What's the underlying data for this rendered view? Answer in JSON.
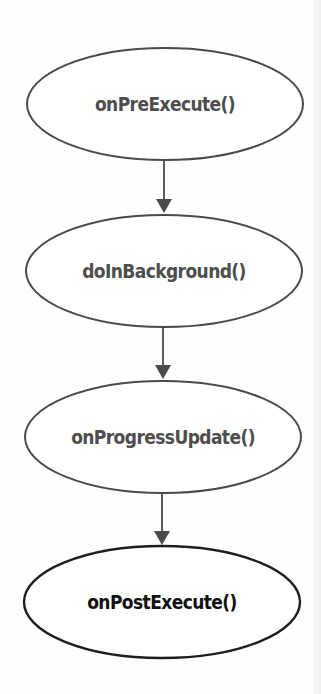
{
  "diagram": {
    "type": "flowchart",
    "colors": {
      "stroke": "#4a4a4a",
      "stroke_final": "#1e1e1e",
      "text": "#4d4d4d",
      "text_final": "#111111",
      "background": "#fefefe"
    },
    "nodes": [
      {
        "id": "onPreExecute",
        "label": "onPreExecute()"
      },
      {
        "id": "doInBackground",
        "label": "doInBackground()"
      },
      {
        "id": "onProgressUpdate",
        "label": "onProgressUpdate()"
      },
      {
        "id": "onPostExecute",
        "label": "onPostExecute()"
      }
    ],
    "edges": [
      {
        "from": "onPreExecute",
        "to": "doInBackground"
      },
      {
        "from": "doInBackground",
        "to": "onProgressUpdate"
      },
      {
        "from": "onProgressUpdate",
        "to": "onPostExecute"
      }
    ]
  }
}
